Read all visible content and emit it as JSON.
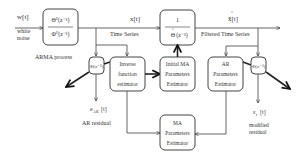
{
  "diagram": {
    "inputs": {
      "signal": "w[t]",
      "signal_desc_line1": "white",
      "signal_desc_line2": "noise"
    },
    "arma_block": {
      "numerator": "Θ°(z⁻¹)",
      "denominator": "Φ°(z⁻¹)",
      "caption": "ARMA process"
    },
    "time_series": {
      "signal": "x[t]",
      "caption": "Time Series"
    },
    "inverse_ma_block": {
      "numerator": "1",
      "denominator": "Θ̂(z⁻¹)",
      "denominator_base": "Θ",
      "denominator_arg": "(z⁻¹)"
    },
    "filtered": {
      "signal": "x̂[t]",
      "caption": "Filtered Time Series"
    },
    "phi_left_block": {
      "label": "Φ(z⁻¹)"
    },
    "inverse_function_estimator": {
      "line1": "Inverse",
      "line2": "function",
      "line3": "estimator"
    },
    "initial_ma_estimator": {
      "line1": "Initial MA",
      "line2": "Parameters",
      "line3": "Estimator"
    },
    "ar_estimator": {
      "line1": "AR",
      "line2": "Parameters",
      "line3": "Estimator"
    },
    "phi_right_block": {
      "label": "Φ(z⁻¹)"
    },
    "ma_estimator": {
      "line1": "MA",
      "line2": "Parameters",
      "line3": "Estimator"
    },
    "ar_residual": {
      "signal": "e",
      "subscript": "AR",
      "arg": "[t]",
      "caption": "AR residual"
    },
    "modified_residual": {
      "signal": "ε",
      "subscript": "t",
      "arg": "[t]",
      "caption_line1": "modified",
      "caption_line2": "residual"
    }
  }
}
